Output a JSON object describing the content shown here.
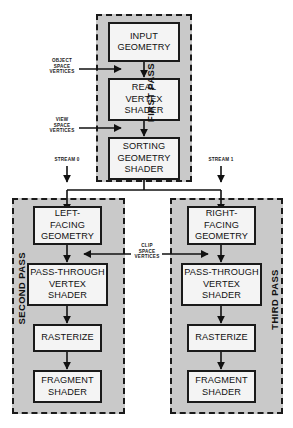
{
  "diagram": {
    "colors": {
      "panel_fill": "#c9c9c9",
      "panel_border": "#1a1a1a",
      "box_fill": "#f4f4f4",
      "box_border": "#1a1a1a",
      "line": "#111111",
      "page_background": "#ffffff"
    }
  },
  "passes": [
    {
      "id": "first",
      "caption": "FIRST PASS",
      "nodes": [
        {
          "id": "input-geometry",
          "label": "INPUT\nGEOMETRY"
        },
        {
          "id": "real-vertex-shader",
          "label": "REAL\nVERTEX\nSHADER"
        },
        {
          "id": "sorting-geometry-shader",
          "label": "SORTING\nGEOMETRY\nSHADER"
        }
      ]
    },
    {
      "id": "second",
      "caption": "SECOND PASS",
      "nodes": [
        {
          "id": "left-facing-geometry",
          "label": "LEFT-\nFACING\nGEOMETRY"
        },
        {
          "id": "pass-through-vertex-shader-left",
          "label": "PASS-THROUGH\nVERTEX\nSHADER"
        },
        {
          "id": "rasterize-left",
          "label": "RASTERIZE"
        },
        {
          "id": "fragment-shader-left",
          "label": "FRAGMENT\nSHADER"
        }
      ]
    },
    {
      "id": "third",
      "caption": "THIRD PASS",
      "nodes": [
        {
          "id": "right-facing-geometry",
          "label": "RIGHT-\nFACING\nGEOMETRY"
        },
        {
          "id": "pass-through-vertex-shader-right",
          "label": "PASS-THROUGH\nVERTEX\nSHADER"
        },
        {
          "id": "rasterize-right",
          "label": "RASTERIZE"
        },
        {
          "id": "fragment-shader-right",
          "label": "FRAGMENT\nSHADER"
        }
      ]
    }
  ],
  "edge_labels": {
    "object_space_vertices": "OBJECT\nSPACE\nVERTICES",
    "view_space_vertices": "VIEW\nSPACE\nVERTICES",
    "clip_space_vertices": "CLIP\nSPACE\nVERTICES",
    "stream_0": "STREAM 0",
    "stream_1": "STREAM 1"
  }
}
